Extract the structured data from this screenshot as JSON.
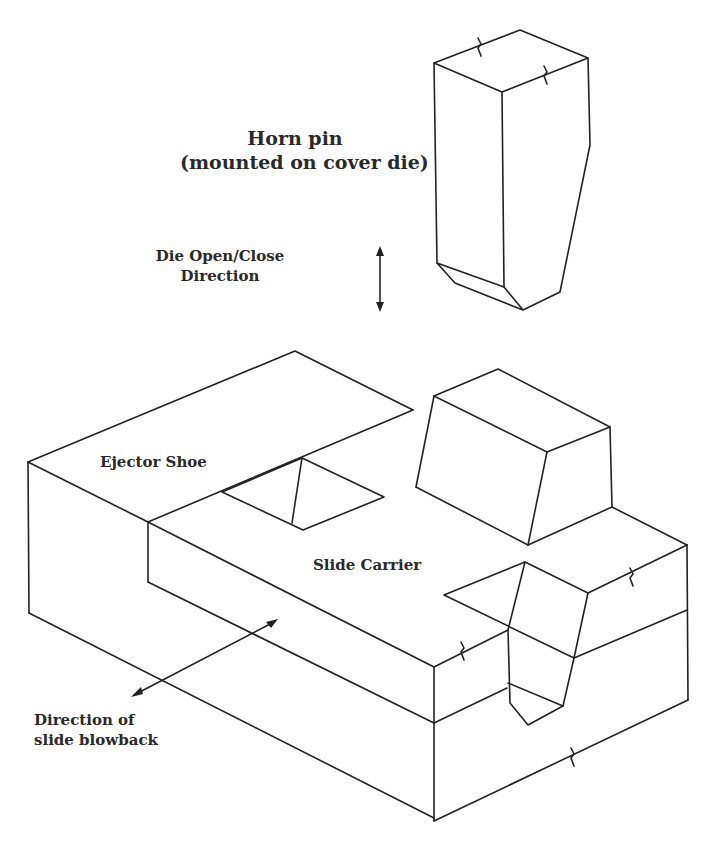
{
  "labels": {
    "horn_pin_line1": "Horn pin",
    "horn_pin_line2": "(mounted on cover die)",
    "die_dir_line1": "Die Open/Close",
    "die_dir_line2": "Direction",
    "ejector_shoe": "Ejector Shoe",
    "slide_carrier": "Slide Carrier",
    "blowback_line1": "Direction of",
    "blowback_line2": "slide blowback"
  },
  "colors": {
    "stroke": "#222222",
    "text": "#2a2a2a",
    "background": "#ffffff"
  }
}
